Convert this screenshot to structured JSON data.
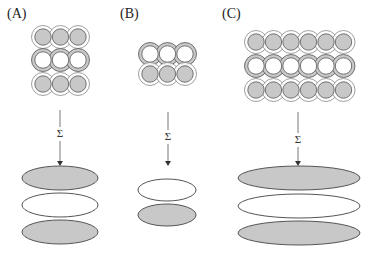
{
  "figure": {
    "panels": [
      {
        "id": "A",
        "label": "(A)",
        "label_pos": [
          7,
          18
        ],
        "lattice": {
          "columns": 3,
          "x0": 43,
          "dx": 17.5,
          "rows_y": [
            37,
            60,
            84
          ],
          "row_types": [
            "inner-gray",
            "ring-gray",
            "inner-gray"
          ]
        },
        "arrow": {
          "x": 60,
          "y1": 110,
          "y2": 166,
          "sigma": "Σ",
          "sigma_y": 137
        },
        "ellipses": [
          {
            "cx": 60,
            "cy": 178,
            "rx": 38,
            "ry": 12,
            "fill": "gray"
          },
          {
            "cx": 60,
            "cy": 205,
            "rx": 38,
            "ry": 12,
            "fill": "white"
          },
          {
            "cx": 60,
            "cy": 232,
            "rx": 38,
            "ry": 12,
            "fill": "gray"
          }
        ]
      },
      {
        "id": "B",
        "label": "(B)",
        "label_pos": [
          120,
          18
        ],
        "lattice": {
          "columns": 3,
          "x0": 150,
          "dx": 17.5,
          "rows_y": [
            54,
            74
          ],
          "row_types": [
            "ring-gray",
            "inner-gray"
          ]
        },
        "arrow": {
          "x": 168,
          "y1": 112,
          "y2": 166,
          "sigma": "Σ",
          "sigma_y": 140
        },
        "ellipses": [
          {
            "cx": 167,
            "cy": 190,
            "rx": 29,
            "ry": 11,
            "fill": "white"
          },
          {
            "cx": 167,
            "cy": 215,
            "rx": 29,
            "ry": 11,
            "fill": "gray"
          }
        ]
      },
      {
        "id": "C",
        "label": "(C)",
        "label_pos": [
          222,
          18
        ],
        "lattice": {
          "columns": 6,
          "x0": 256,
          "dx": 17.5,
          "rows_y": [
            42,
            66,
            90
          ],
          "row_types": [
            "inner-gray",
            "ring-gray",
            "inner-gray"
          ]
        },
        "arrow": {
          "x": 298,
          "y1": 112,
          "y2": 166,
          "sigma": "Σ",
          "sigma_y": 143
        },
        "ellipses": [
          {
            "cx": 299,
            "cy": 178,
            "rx": 61,
            "ry": 12,
            "fill": "gray"
          },
          {
            "cx": 299,
            "cy": 206,
            "rx": 61,
            "ry": 12,
            "fill": "white"
          },
          {
            "cx": 299,
            "cy": 233,
            "rx": 61,
            "ry": 12,
            "fill": "gray"
          }
        ]
      }
    ],
    "colors": {
      "gray_fill": "#c8c8c8",
      "stroke": "#555555",
      "light_stroke": "#777777",
      "white": "#ffffff"
    }
  }
}
